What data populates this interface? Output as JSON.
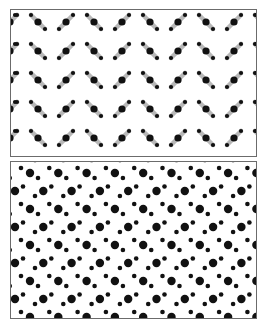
{
  "figure": {
    "width": 270,
    "height": 329,
    "background": "#ffffff",
    "border_color": "#6b6b6b",
    "dot_color": "#111111",
    "bond_color": "#b8b8b8"
  },
  "panels": [
    {
      "id": "top",
      "description": "herringbone lattice of tilted three-atom molecules with gray bonds",
      "x": 10,
      "y": 9,
      "w": 247,
      "h": 148,
      "rows_y": [
        14,
        43,
        72,
        101,
        130
      ],
      "pair_period_x": 56,
      "first_backslash_center_x": 37,
      "molecule_dy": 7,
      "molecule_dx": 7,
      "big_radius": 3.6,
      "small_radius": 2.1,
      "bond_width": 4.5,
      "edge_dot_xs": [
        14,
        256
      ]
    },
    {
      "id": "bottom",
      "description": "dense lattice of large and small dots arranged in diagonal triplets",
      "x": 10,
      "y": 161,
      "w": 247,
      "h": 158,
      "period_x": 28.3,
      "period_y": 36,
      "row_a_start": {
        "big_x": 29,
        "big_y": 172
      },
      "row_b_start": {
        "big_x": 14,
        "big_y": 190
      },
      "row_a_small_offsets": [
        [
          -9,
          -5
        ],
        [
          8,
          5
        ]
      ],
      "row_b_small_offsets": [
        [
          8,
          -4.5
        ],
        [
          20,
          5
        ]
      ],
      "big_radius": 4.2,
      "small_radius": 2.3
    }
  ]
}
